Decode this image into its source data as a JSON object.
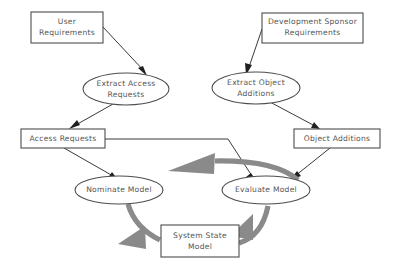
{
  "diagram": {
    "background_color": "#ffffff",
    "node_stroke_color": "#4d4d4d",
    "thin_edge_color": "#3a3a3a",
    "cycle_edge_color": "#8a8a8a",
    "label_color": "#555555",
    "nodes": [
      {
        "id": "user-requirements",
        "shape": "box",
        "label_line1": "User",
        "label_line2": "Requirements",
        "x": 31,
        "y": 12,
        "w": 72,
        "h": 31
      },
      {
        "id": "development-sponsor-requirements",
        "shape": "box",
        "label_line1": "Development Sponsor",
        "label_line2": "Requirements",
        "x": 262,
        "y": 13,
        "w": 101,
        "h": 30
      },
      {
        "id": "extract-access-requests",
        "shape": "ellipse",
        "label_line1": "Extract Access",
        "label_line2": "Requests",
        "cx": 126,
        "cy": 89,
        "rx": 43,
        "ry": 16
      },
      {
        "id": "extract-object-additions",
        "shape": "ellipse",
        "label_line1": "Extract Object",
        "label_line2": "Additions",
        "cx": 256,
        "cy": 88,
        "rx": 44,
        "ry": 16
      },
      {
        "id": "access-requests",
        "shape": "box",
        "label_line1": "Access Requests",
        "label_line2": "",
        "x": 21,
        "y": 129,
        "w": 84,
        "h": 19
      },
      {
        "id": "object-additions",
        "shape": "box",
        "label_line1": "Object Additions",
        "label_line2": "",
        "x": 294,
        "y": 129,
        "w": 86,
        "h": 19
      },
      {
        "id": "nominate-model",
        "shape": "ellipse",
        "label_line1": "Nominate Model",
        "label_line2": "",
        "cx": 119,
        "cy": 190,
        "rx": 44,
        "ry": 14
      },
      {
        "id": "evaluate-model",
        "shape": "ellipse",
        "label_line1": "Evaluate Model",
        "label_line2": "",
        "cx": 266,
        "cy": 190,
        "rx": 44,
        "ry": 14
      },
      {
        "id": "system-state-model",
        "shape": "box",
        "label_line1": "System State",
        "label_line2": "Model",
        "x": 161,
        "y": 225,
        "w": 78,
        "h": 32
      }
    ],
    "edges": [
      {
        "id": "edge-user-req-to-extract-access",
        "from": "user-requirements",
        "to": "extract-access-requests",
        "style": "thin"
      },
      {
        "id": "edge-dev-req-to-extract-object",
        "from": "development-sponsor-requirements",
        "to": "extract-object-additions",
        "style": "thin"
      },
      {
        "id": "edge-extract-access-to-access-requests",
        "from": "extract-access-requests",
        "to": "access-requests",
        "style": "thin"
      },
      {
        "id": "edge-extract-object-to-object-additions",
        "from": "extract-object-additions",
        "to": "object-additions",
        "style": "thin"
      },
      {
        "id": "edge-access-requests-to-nominate",
        "from": "access-requests",
        "to": "nominate-model",
        "style": "thin"
      },
      {
        "id": "edge-access-requests-to-evaluate",
        "from": "access-requests",
        "to": "evaluate-model",
        "style": "thin"
      },
      {
        "id": "edge-object-additions-to-evaluate",
        "from": "object-additions",
        "to": "evaluate-model",
        "style": "thin"
      },
      {
        "id": "edge-nominate-to-system-state",
        "from": "nominate-model",
        "to": "system-state-model",
        "style": "cycle"
      },
      {
        "id": "edge-system-state-to-evaluate",
        "from": "system-state-model",
        "to": "evaluate-model",
        "style": "cycle"
      },
      {
        "id": "edge-evaluate-to-nominate",
        "from": "evaluate-model",
        "to": "nominate-model",
        "style": "cycle"
      }
    ]
  }
}
